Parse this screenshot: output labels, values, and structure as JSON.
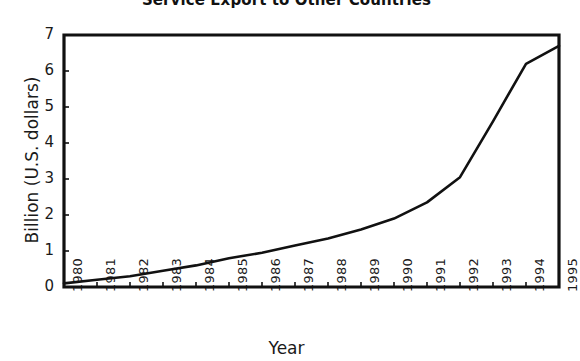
{
  "chart_data": {
    "type": "line",
    "title": "Service Export to Other Countries",
    "xlabel": "Year",
    "ylabel": "Billion (U.S. dollars)",
    "categories": [
      "1980",
      "1981",
      "1982",
      "1983",
      "1984",
      "1985",
      "1986",
      "1987",
      "1988",
      "1989",
      "1990",
      "1991",
      "1992",
      "1993",
      "1994",
      "1995"
    ],
    "x": [
      1980,
      1981,
      1982,
      1983,
      1984,
      1985,
      1986,
      1987,
      1988,
      1989,
      1990,
      1991,
      1992,
      1993,
      1994,
      1995
    ],
    "values": [
      0.1,
      0.2,
      0.3,
      0.45,
      0.6,
      0.8,
      0.95,
      1.15,
      1.35,
      1.6,
      1.9,
      2.35,
      3.05,
      4.6,
      6.2,
      6.7
    ],
    "ylim": [
      0,
      7
    ],
    "yticks": [
      0,
      1,
      2,
      3,
      4,
      5,
      6,
      7
    ],
    "ytick_labels": [
      "0",
      "1",
      "2",
      "3",
      "4",
      "5",
      "6",
      "7"
    ],
    "grid": false,
    "legend": null,
    "series": [
      {
        "name": "Service Export",
        "values": [
          0.1,
          0.2,
          0.3,
          0.45,
          0.6,
          0.8,
          0.95,
          1.15,
          1.35,
          1.6,
          1.9,
          2.35,
          3.05,
          4.6,
          6.2,
          6.7
        ]
      }
    ],
    "line_color": "#111111",
    "axis_color": "#111111",
    "background": "#ffffff"
  }
}
